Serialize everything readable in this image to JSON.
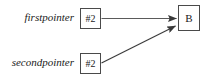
{
  "diagram": {
    "type": "pointer-aliasing-diagram",
    "colors": {
      "background": "#ffffff",
      "box_border": "#4a4a4a",
      "edge": "#3a3a3a",
      "text": "#1a1a1a"
    },
    "variables": [
      {
        "id": "firstpointer",
        "label": "firstpointer",
        "value": "#2"
      },
      {
        "id": "secondpointer",
        "label": "secondpointer",
        "value": "#2"
      }
    ],
    "target": {
      "id": "target-b",
      "label": "B"
    },
    "edges": [
      {
        "from": "firstpointer",
        "to": "target-b",
        "style": "straight-horizontal-arrow"
      },
      {
        "from": "secondpointer",
        "to": "target-b",
        "style": "diagonal-arrow"
      }
    ]
  }
}
